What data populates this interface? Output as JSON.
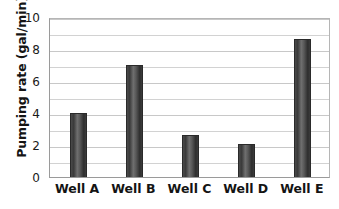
{
  "chart_data": {
    "type": "bar",
    "title": "",
    "subtitle": "",
    "xlabel": "",
    "ylabel": "Pumping rate (gal/min)",
    "categories": [
      "Well A",
      "Well B",
      "Well C",
      "Well D",
      "Well E"
    ],
    "values": [
      4.0,
      7.0,
      2.6,
      2.05,
      8.6
    ],
    "series": [
      {
        "name": "Pumping rate",
        "values": [
          4.0,
          7.0,
          2.6,
          2.05,
          8.6
        ]
      }
    ],
    "ylim": [
      0,
      10
    ],
    "y_major_ticks": [
      0,
      2,
      4,
      6,
      8,
      10
    ],
    "y_tick_labels": [
      "0",
      "2",
      "4",
      "6",
      "8",
      "10"
    ],
    "y_minor_tick_step": 1,
    "grid": "horizontal",
    "gridlines_major": [
      0,
      1,
      2,
      3,
      4,
      5,
      6,
      7,
      8,
      9,
      10
    ],
    "legend": "none",
    "legend_position": "none",
    "annotations": [],
    "colors": {
      "bar_fill_dark": "#3a3a3a",
      "bar_fill_light": "#6f6f6f",
      "bar_edge": "#2a2a2a",
      "gridline": "#d2d2d2",
      "axis_line": "#9a9a9a",
      "text": "#141414",
      "background": "#ffffff"
    }
  }
}
